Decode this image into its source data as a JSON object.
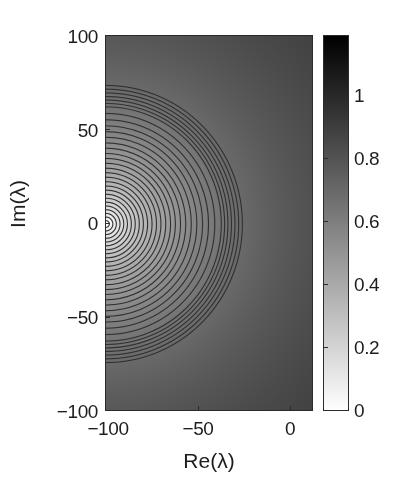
{
  "figure": {
    "xlabel": "Re(λ)",
    "ylabel": "Im(λ)"
  },
  "axes": {
    "x_ticks": [
      {
        "label": "−100",
        "value": -100
      },
      {
        "label": "−50",
        "value": -50
      },
      {
        "label": "0",
        "value": 0
      }
    ],
    "y_ticks": [
      {
        "label": "100",
        "value": 100
      },
      {
        "label": "50",
        "value": 50
      },
      {
        "label": "0",
        "value": 0
      },
      {
        "label": "−50",
        "value": -50
      },
      {
        "label": "−100",
        "value": -100
      }
    ]
  },
  "colorbar": {
    "ticks": [
      {
        "label": "1",
        "value": 1.0
      },
      {
        "label": "0.8",
        "value": 0.8
      },
      {
        "label": "0.6",
        "value": 0.6
      },
      {
        "label": "0.4",
        "value": 0.4
      },
      {
        "label": "0.2",
        "value": 0.2
      },
      {
        "label": "0",
        "value": 0.0
      }
    ],
    "low_color": "#ffffff",
    "high_color": "#000000",
    "orientation": "vertical"
  },
  "chart_data": {
    "type": "heatmap",
    "title": "",
    "xlabel": "Re(λ)",
    "ylabel": "Im(λ)",
    "xlim": [
      -100,
      12.4
    ],
    "ylim": [
      -100,
      100
    ],
    "clim": [
      0,
      1.19
    ],
    "grid": false,
    "legend": "colorbar-right",
    "colormap": "gray-reversed",
    "overlay": "contour-lines",
    "contour_color": "#303030",
    "field": {
      "description": "Radially symmetric scalar field about the singular point; value rises monotonically with distance from the centre and saturates toward the right-hand edge.",
      "center": [
        -100,
        0
      ],
      "formula": "v(r) = 1.19 * (r / (r + 52))",
      "r_definition": "r = sqrt((Re+100)^2 + Im^2)",
      "value_at_center": 0.0,
      "value_at_right_edge_mid": 1.13
    },
    "contour_levels": [
      0.04,
      0.08,
      0.12,
      0.16,
      0.2,
      0.24,
      0.28,
      0.32,
      0.36,
      0.4,
      0.44,
      0.48,
      0.52,
      0.56,
      0.6,
      0.64,
      0.68,
      0.72,
      0.76,
      0.8,
      0.84,
      0.88,
      0.92,
      0.96,
      1.0,
      1.02,
      1.04,
      1.06,
      1.08,
      1.1,
      1.12
    ],
    "contour_radii_from_center": [
      1.8,
      3.7,
      5.6,
      7.6,
      9.6,
      11.6,
      13.7,
      15.8,
      18.0,
      20.2,
      22.5,
      24.9,
      27.3,
      29.7,
      32.3,
      34.9,
      37.5,
      40.3,
      43.1,
      46.1,
      49.1,
      52.2,
      55.4,
      58.8,
      62.3,
      64.1,
      65.9,
      67.8,
      69.7,
      71.7,
      73.7
    ],
    "colorbar_ticks": [
      0,
      0.2,
      0.4,
      0.6,
      0.8,
      1.0
    ]
  }
}
